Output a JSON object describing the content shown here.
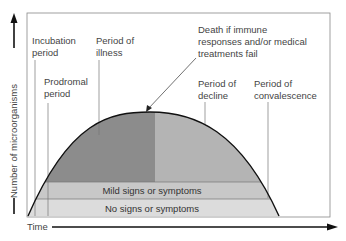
{
  "diagram": {
    "y_axis_label": "Number of microorganisms",
    "x_axis_label": "Time",
    "periods": [
      {
        "lines": [
          "Incubation",
          "period"
        ]
      },
      {
        "lines": [
          "Prodromal",
          "period"
        ]
      },
      {
        "lines": [
          "Period of",
          "illness"
        ]
      },
      {
        "lines": [
          "Period of",
          "decline"
        ]
      },
      {
        "lines": [
          "Period of",
          "convalescence"
        ]
      }
    ],
    "annotation": {
      "lines": [
        "Death if immune",
        "responses and/or medical",
        "treatments fail"
      ]
    },
    "bands": {
      "mild": "Mild signs or symptoms",
      "none": "No signs or symptoms"
    },
    "colors": {
      "illness_fill": "#8c8c8c",
      "decline_fill": "#b4b4b4",
      "mild_band": "#c8c8c8",
      "none_band": "#dcdcdc",
      "frame": "#888888",
      "curve": "#111111"
    }
  }
}
